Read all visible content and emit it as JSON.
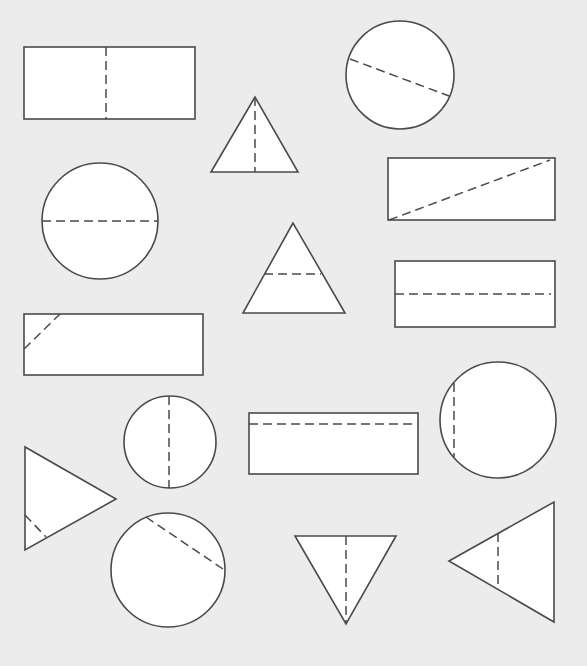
{
  "diagram": {
    "background": "#ececec",
    "stroke_color": "#4a4a4a",
    "fill_color": "#ffffff",
    "shapes": [
      {
        "id": "rect-1",
        "type": "rect",
        "x": 24,
        "y": 47,
        "w": 171,
        "h": 72,
        "fold": [
          106,
          47,
          106,
          119
        ]
      },
      {
        "id": "triangle-1",
        "type": "polygon",
        "points": "255,97 211,172 298,172",
        "fold": [
          255,
          97,
          255,
          172
        ]
      },
      {
        "id": "circle-1",
        "type": "circle",
        "cx": 400,
        "cy": 75,
        "r": 54,
        "fold": [
          350,
          59,
          449,
          96
        ]
      },
      {
        "id": "rect-2",
        "type": "rect",
        "x": 388,
        "y": 158,
        "w": 167,
        "h": 62,
        "fold": [
          389,
          220,
          550,
          160
        ]
      },
      {
        "id": "circle-2",
        "type": "circle",
        "cx": 100,
        "cy": 221,
        "r": 58,
        "fold": [
          42,
          221,
          158,
          221
        ]
      },
      {
        "id": "triangle-2",
        "type": "polygon",
        "points": "293,223 243,313 345,313",
        "fold": [
          264,
          274,
          321,
          274
        ]
      },
      {
        "id": "rect-3",
        "type": "rect",
        "x": 395,
        "y": 261,
        "w": 160,
        "h": 66,
        "fold": [
          395,
          294,
          551,
          294
        ]
      },
      {
        "id": "rect-4",
        "type": "rect",
        "x": 24,
        "y": 314,
        "w": 179,
        "h": 61,
        "fold": [
          24,
          349,
          60,
          314
        ]
      },
      {
        "id": "circle-3",
        "type": "circle",
        "cx": 498,
        "cy": 420,
        "r": 58,
        "fold": [
          454,
          383,
          454,
          457
        ]
      },
      {
        "id": "circle-4",
        "type": "circle",
        "cx": 170,
        "cy": 442,
        "r": 46,
        "fold": [
          169,
          396,
          169,
          488
        ]
      },
      {
        "id": "rect-5",
        "type": "rect",
        "x": 249,
        "y": 413,
        "w": 169,
        "h": 61,
        "fold": [
          249,
          424,
          418,
          424
        ]
      },
      {
        "id": "triangle-3",
        "type": "polygon",
        "points": "25,447 25,550 116,499",
        "fold": [
          25,
          515,
          46,
          537
        ]
      },
      {
        "id": "circle-5",
        "type": "circle",
        "cx": 168,
        "cy": 570,
        "r": 57,
        "fold": [
          146,
          517,
          223,
          569
        ]
      },
      {
        "id": "triangle-4",
        "type": "polygon",
        "points": "295,536 396,536 346,624",
        "fold": [
          346,
          536,
          346,
          624
        ]
      },
      {
        "id": "triangle-5",
        "type": "polygon",
        "points": "449,561 554,502 554,622",
        "fold": [
          498,
          533,
          498,
          589
        ]
      }
    ]
  }
}
